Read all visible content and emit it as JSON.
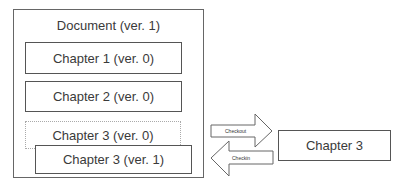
{
  "document": {
    "title": "Document (ver. 1)"
  },
  "chapters": [
    {
      "label": "Chapter 1 (ver. 0)"
    },
    {
      "label": "Chapter 2 (ver. 0)"
    },
    {
      "label": "Chapter 3 (ver. 0)"
    },
    {
      "label": "Chapter 3 (ver. 1)"
    }
  ],
  "arrows": {
    "checkout": "Checkout",
    "checkin": "Checkin"
  },
  "external": {
    "label": "Chapter 3"
  }
}
